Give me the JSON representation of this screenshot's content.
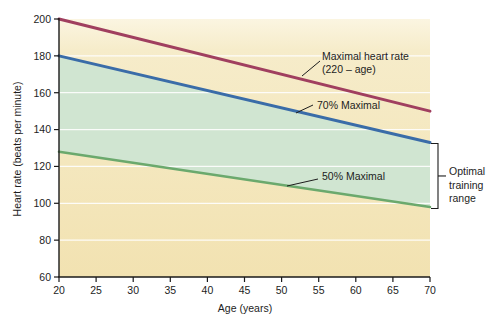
{
  "chart_data": {
    "type": "line",
    "title": "",
    "xlabel": "Age (years)",
    "ylabel": "Heart rate (beats per minute)",
    "xlim": [
      20,
      70
    ],
    "ylim": [
      60,
      200
    ],
    "x_ticks": [
      20,
      25,
      30,
      35,
      40,
      45,
      50,
      55,
      60,
      65,
      70
    ],
    "y_ticks": [
      60,
      80,
      100,
      120,
      140,
      160,
      180,
      200
    ],
    "grid": {
      "show": true,
      "axis": "y",
      "values": [
        80,
        100,
        120,
        140,
        160,
        180
      ],
      "color": "#ffffff"
    },
    "plot_background": [
      "#fbf5e1",
      "#f6ecca",
      "#f2e2b1"
    ],
    "axis_color": "#1a1a1a",
    "series": [
      {
        "name": "Maximal heart rate (220 – age)",
        "color": "#a03f5f",
        "x": [
          20,
          70
        ],
        "values": [
          200,
          150
        ]
      },
      {
        "name": "70% Maximal",
        "color": "#3a6ca8",
        "x": [
          20,
          70
        ],
        "values": [
          180,
          133
        ]
      },
      {
        "name": "50% Maximal",
        "color": "#6ba96d",
        "x": [
          20,
          70
        ],
        "values": [
          128,
          98
        ]
      }
    ],
    "band": {
      "label": "Optimal training range",
      "between": [
        "70% Maximal",
        "50% Maximal"
      ],
      "color": "#d0e5d1",
      "at_age": 70,
      "from_value": 98,
      "to_value": 133
    },
    "annotations": {
      "maximal": {
        "line1": "Maximal heart rate",
        "line2": "(220 – age)"
      },
      "seventy": "70% Maximal",
      "fifty": "50% Maximal",
      "optimal": {
        "line1": "Optimal",
        "line2": "training",
        "line3": "range"
      }
    },
    "legend": "none"
  }
}
